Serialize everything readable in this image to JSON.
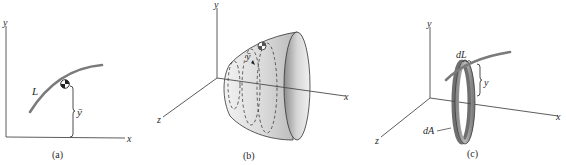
{
  "figure": {
    "panels": [
      {
        "id": "a",
        "caption": "(a)",
        "axes": {
          "y": "y",
          "x": "x"
        },
        "labels": {
          "curve": "L",
          "centroid_distance": "ȳ"
        }
      },
      {
        "id": "b",
        "caption": "(b)",
        "axes": {
          "y": "y",
          "x": "x",
          "z": "z"
        },
        "labels": {
          "centroid_distance": "ȳ"
        }
      },
      {
        "id": "c",
        "caption": "(c)",
        "axes": {
          "y": "y",
          "x": "x",
          "z": "z"
        },
        "labels": {
          "element_length": "dL",
          "distance": "y",
          "element_area": "dA"
        }
      }
    ],
    "colors": {
      "curve": "#7a7a7a",
      "surface_light": "#e6e6e6",
      "surface_dark": "#9a9a9a",
      "axis": "#4a4a4a"
    }
  }
}
